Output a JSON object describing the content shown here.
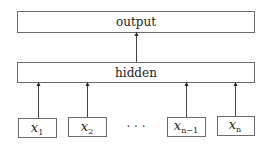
{
  "diagram": {
    "output_layer": {
      "label": "output"
    },
    "hidden_layer": {
      "label": "hidden"
    },
    "inputs": [
      {
        "var": "x",
        "sub": "1"
      },
      {
        "var": "x",
        "sub": "2"
      },
      {
        "var": "x",
        "sub": "n−1"
      },
      {
        "var": "x",
        "sub": "n"
      }
    ],
    "ellipsis": "· · ·",
    "edges": [
      {
        "from": "x_1",
        "to": "hidden"
      },
      {
        "from": "x_2",
        "to": "hidden"
      },
      {
        "from": "x_{n-1}",
        "to": "hidden"
      },
      {
        "from": "x_n",
        "to": "hidden"
      },
      {
        "from": "hidden",
        "to": "output"
      }
    ]
  }
}
